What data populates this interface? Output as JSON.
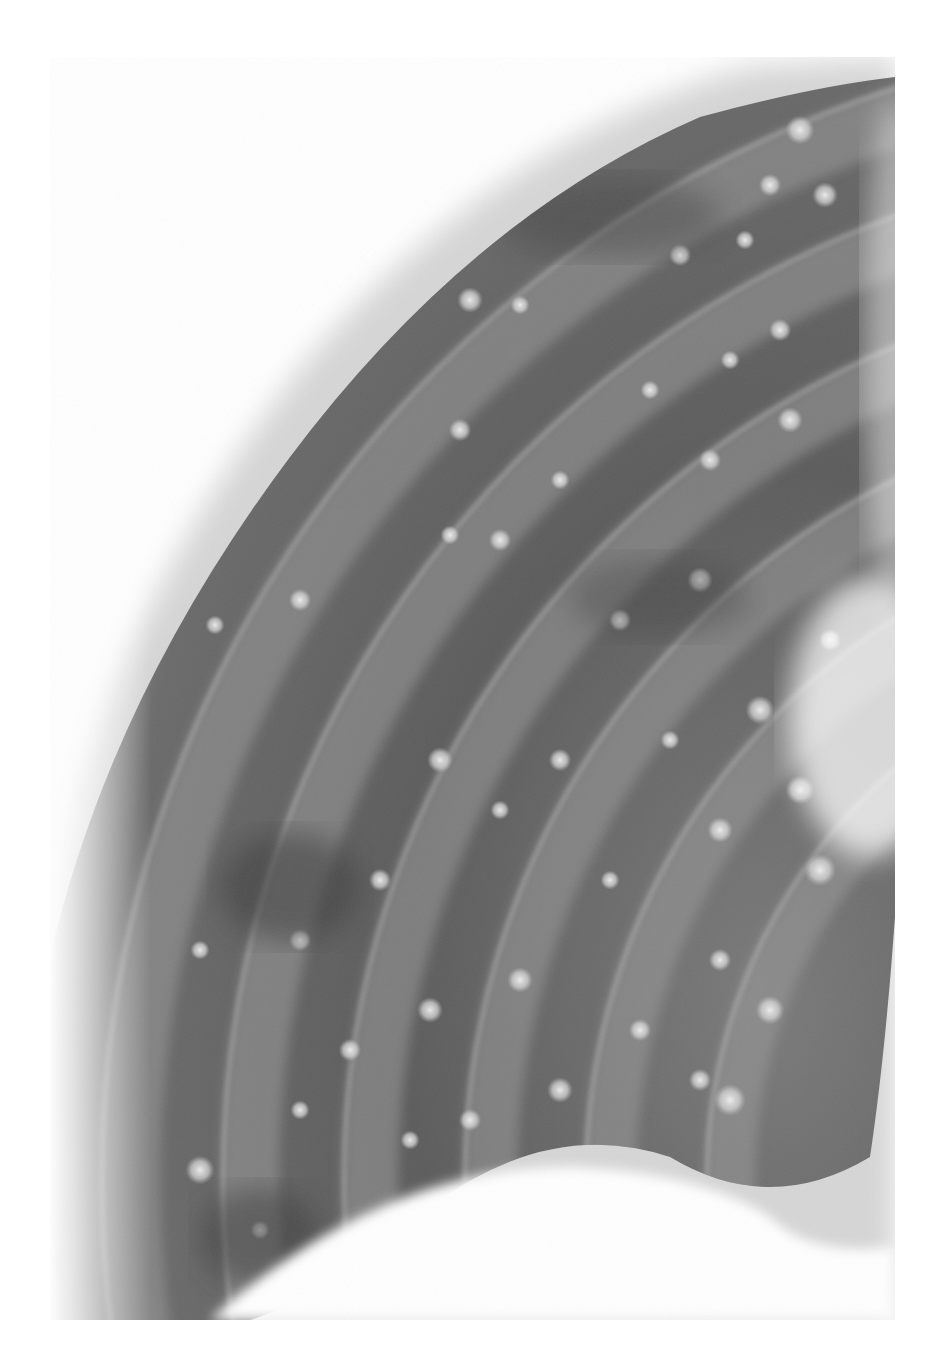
{
  "image": {
    "subject": "chest radiograph - rib cage segment with multiple nodular opacities",
    "background_color": "#ffffff",
    "frame": {
      "x": 50,
      "y": 57,
      "width": 845,
      "height": 1263
    },
    "palette": {
      "lung_dark": "#4a4a4a",
      "lung_mid": "#6e6e6e",
      "rib_band": "#9a9a9a",
      "soft_tissue": "#d4d4d4",
      "nodule": "#e6e6e6"
    },
    "ribs": [
      {
        "cx": 1250,
        "cy": 1180,
        "r": 1120,
        "width": 60
      },
      {
        "cx": 1250,
        "cy": 1180,
        "r": 1000,
        "width": 58
      },
      {
        "cx": 1250,
        "cy": 1180,
        "r": 880,
        "width": 56
      },
      {
        "cx": 1250,
        "cy": 1180,
        "r": 760,
        "width": 54
      },
      {
        "cx": 1250,
        "cy": 1180,
        "r": 640,
        "width": 52
      },
      {
        "cx": 1250,
        "cy": 1180,
        "r": 520,
        "width": 50
      }
    ],
    "nodules": [
      [
        800,
        130,
        9
      ],
      [
        770,
        185,
        7
      ],
      [
        825,
        195,
        8
      ],
      [
        745,
        240,
        6
      ],
      [
        680,
        255,
        7
      ],
      [
        470,
        300,
        8
      ],
      [
        520,
        305,
        6
      ],
      [
        780,
        330,
        7
      ],
      [
        730,
        360,
        6
      ],
      [
        650,
        390,
        6
      ],
      [
        460,
        430,
        7
      ],
      [
        790,
        420,
        8
      ],
      [
        710,
        460,
        7
      ],
      [
        560,
        480,
        6
      ],
      [
        500,
        540,
        7
      ],
      [
        450,
        535,
        6
      ],
      [
        700,
        580,
        8
      ],
      [
        620,
        620,
        7
      ],
      [
        300,
        600,
        7
      ],
      [
        215,
        625,
        6
      ],
      [
        140,
        660,
        8
      ],
      [
        830,
        640,
        7
      ],
      [
        760,
        710,
        9
      ],
      [
        670,
        740,
        6
      ],
      [
        560,
        760,
        7
      ],
      [
        440,
        760,
        8
      ],
      [
        500,
        810,
        6
      ],
      [
        800,
        790,
        9
      ],
      [
        720,
        830,
        8
      ],
      [
        820,
        870,
        10
      ],
      [
        610,
        880,
        6
      ],
      [
        380,
        880,
        7
      ],
      [
        300,
        940,
        7
      ],
      [
        200,
        950,
        6
      ],
      [
        720,
        960,
        7
      ],
      [
        520,
        980,
        8
      ],
      [
        430,
        1010,
        8
      ],
      [
        350,
        1050,
        7
      ],
      [
        640,
        1030,
        7
      ],
      [
        770,
        1010,
        9
      ],
      [
        700,
        1080,
        7
      ],
      [
        560,
        1090,
        8
      ],
      [
        470,
        1120,
        7
      ],
      [
        410,
        1140,
        6
      ],
      [
        300,
        1110,
        6
      ],
      [
        200,
        1170,
        9
      ],
      [
        260,
        1230,
        6
      ],
      [
        730,
        1100,
        10
      ]
    ]
  }
}
